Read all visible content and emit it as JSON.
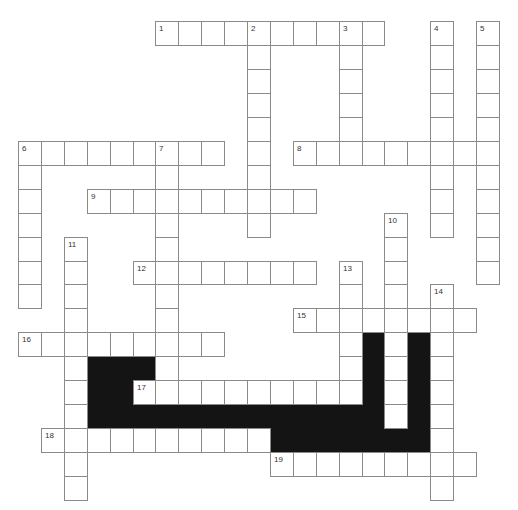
{
  "puzzle": {
    "type": "crossword",
    "grid": {
      "origin_x": 18,
      "origin_y": 21,
      "cell_w": 22.9,
      "cell_h": 23.95,
      "line_color": "#8a8a8a",
      "block_color": "#141414"
    },
    "entries": [
      {
        "number": "1",
        "dir": "across",
        "row": 0,
        "col": 6,
        "length": 10
      },
      {
        "number": "2",
        "dir": "down",
        "row": 0,
        "col": 10,
        "length": 9
      },
      {
        "number": "3",
        "dir": "down",
        "row": 0,
        "col": 14,
        "length": 6
      },
      {
        "number": "4",
        "dir": "down",
        "row": 0,
        "col": 18,
        "length": 9
      },
      {
        "number": "5",
        "dir": "down",
        "row": 0,
        "col": 20,
        "length": 11
      },
      {
        "number": "6",
        "dir": "across",
        "row": 5,
        "col": 0,
        "length": 9
      },
      {
        "number": "6",
        "dir": "down",
        "row": 5,
        "col": 0,
        "length": 7
      },
      {
        "number": "7",
        "dir": "down",
        "row": 5,
        "col": 6,
        "length": 11
      },
      {
        "number": "8",
        "dir": "across",
        "row": 5,
        "col": 12,
        "length": 9
      },
      {
        "number": "9",
        "dir": "across",
        "row": 7,
        "col": 3,
        "length": 10
      },
      {
        "number": "10",
        "dir": "down",
        "row": 8,
        "col": 16,
        "length": 9
      },
      {
        "number": "11",
        "dir": "down",
        "row": 9,
        "col": 2,
        "length": 11
      },
      {
        "number": "12",
        "dir": "across",
        "row": 10,
        "col": 5,
        "length": 8
      },
      {
        "number": "13",
        "dir": "down",
        "row": 10,
        "col": 14,
        "length": 6
      },
      {
        "number": "14",
        "dir": "down",
        "row": 11,
        "col": 18,
        "length": 9
      },
      {
        "number": "15",
        "dir": "across",
        "row": 12,
        "col": 12,
        "length": 8
      },
      {
        "number": "16",
        "dir": "across",
        "row": 13,
        "col": 0,
        "length": 9
      },
      {
        "number": "17",
        "dir": "across",
        "row": 15,
        "col": 5,
        "length": 10
      },
      {
        "number": "18",
        "dir": "across",
        "row": 17,
        "col": 1,
        "length": 10
      },
      {
        "number": "19",
        "dir": "across",
        "row": 18,
        "col": 11,
        "length": 9
      }
    ],
    "blocks": [
      [
        14,
        3
      ],
      [
        14,
        4
      ],
      [
        14,
        5
      ],
      [
        15,
        3
      ],
      [
        15,
        4
      ],
      [
        16,
        3
      ],
      [
        16,
        4
      ],
      [
        16,
        5
      ],
      [
        16,
        6
      ],
      [
        16,
        7
      ],
      [
        16,
        8
      ],
      [
        16,
        9
      ],
      [
        16,
        10
      ],
      [
        16,
        11
      ],
      [
        16,
        12
      ],
      [
        16,
        13
      ],
      [
        16,
        14
      ],
      [
        16,
        15
      ],
      [
        16,
        17
      ],
      [
        13,
        15
      ],
      [
        14,
        15
      ],
      [
        15,
        15
      ],
      [
        13,
        17
      ],
      [
        14,
        17
      ],
      [
        15,
        17
      ],
      [
        17,
        11
      ],
      [
        17,
        12
      ],
      [
        17,
        13
      ],
      [
        17,
        14
      ],
      [
        17,
        15
      ],
      [
        17,
        16
      ],
      [
        17,
        17
      ]
    ]
  }
}
